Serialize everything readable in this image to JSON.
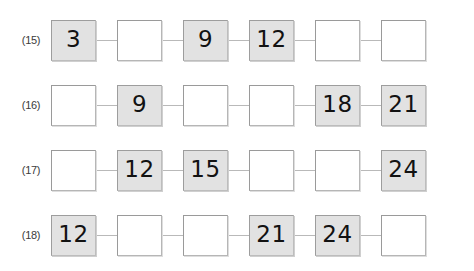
{
  "worksheet": {
    "title": "Number sequence fill-in-the-blank boxes",
    "background_color": "#ffffff",
    "filled_box_color": "#e2e2e2",
    "empty_box_color": "#ffffff",
    "border_color": "#b6b6b6",
    "connector_color": "#b9b9b9",
    "text_color": "#121212",
    "label_color": "#3b3b3b",
    "rows": [
      {
        "label": "(15)",
        "cells": [
          {
            "value": "3",
            "filled": true
          },
          {
            "value": "",
            "filled": false
          },
          {
            "value": "9",
            "filled": true
          },
          {
            "value": "12",
            "filled": true
          },
          {
            "value": "",
            "filled": false
          },
          {
            "value": "",
            "filled": false
          }
        ]
      },
      {
        "label": "(16)",
        "cells": [
          {
            "value": "",
            "filled": false
          },
          {
            "value": "9",
            "filled": true
          },
          {
            "value": "",
            "filled": false
          },
          {
            "value": "",
            "filled": false
          },
          {
            "value": "18",
            "filled": true
          },
          {
            "value": "21",
            "filled": true
          }
        ]
      },
      {
        "label": "(17)",
        "cells": [
          {
            "value": "",
            "filled": false
          },
          {
            "value": "12",
            "filled": true
          },
          {
            "value": "15",
            "filled": true
          },
          {
            "value": "",
            "filled": false
          },
          {
            "value": "",
            "filled": false
          },
          {
            "value": "24",
            "filled": true
          }
        ]
      },
      {
        "label": "(18)",
        "cells": [
          {
            "value": "12",
            "filled": true
          },
          {
            "value": "",
            "filled": false
          },
          {
            "value": "",
            "filled": false
          },
          {
            "value": "21",
            "filled": true
          },
          {
            "value": "24",
            "filled": true
          },
          {
            "value": "",
            "filled": false
          }
        ]
      }
    ]
  }
}
